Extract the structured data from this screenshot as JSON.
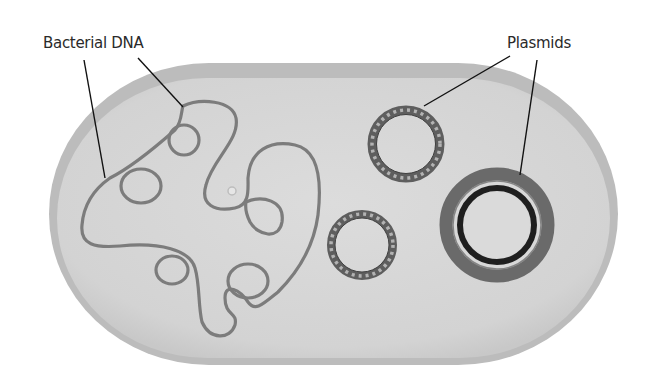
{
  "diagram": {
    "labels": {
      "bacterial_dna": "Bacterial DNA",
      "plasmids": "Plasmids"
    },
    "colors": {
      "background": "#ffffff",
      "cell_wall": "#b9b9b9",
      "cytoplasm": "#d6d6d6",
      "dna_strand": "#7a7a7a",
      "plasmid_ring": "#5a5a5a",
      "plasmid_beads": "#b0b0b0",
      "plasmid_dark_inner": "#222222",
      "leader_line": "#111111",
      "label_text": "#2a2a2a"
    },
    "components": [
      {
        "name": "cell",
        "shape": "capsule"
      },
      {
        "name": "bacterial-dna",
        "shape": "tangled loop"
      },
      {
        "name": "plasmid-top",
        "shape": "beaded ring"
      },
      {
        "name": "plasmid-bottom",
        "shape": "beaded ring"
      },
      {
        "name": "plasmid-large",
        "shape": "double ring"
      }
    ]
  }
}
